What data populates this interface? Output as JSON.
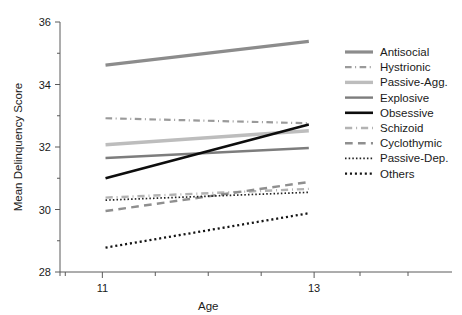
{
  "chart_data": {
    "type": "line",
    "title": "",
    "xlabel": "Age",
    "ylabel": "Mean Delinquency Score",
    "xlim": [
      10.6,
      13.15
    ],
    "ylim": [
      28,
      36
    ],
    "x": [
      11.03,
      12.95
    ],
    "xticks": [
      11,
      13
    ],
    "xtick_labels": [
      "11",
      "13"
    ],
    "xminor_ticks": [
      10.6,
      10.65,
      11.5,
      12.0,
      12.5
    ],
    "yticks": [
      28,
      30,
      32,
      34,
      36
    ],
    "ytick_labels": [
      "28",
      "30",
      "32",
      "34",
      "36"
    ],
    "yminor_ticks": [
      29,
      31,
      33,
      35
    ],
    "grid": false,
    "legend_position": "right",
    "series": [
      {
        "name": "Antisocial",
        "values": [
          34.62,
          35.38
        ],
        "color": "#8c8c8c",
        "dash": "none",
        "width": 3.2
      },
      {
        "name": "Hystrionic",
        "values": [
          32.92,
          32.76
        ],
        "color": "#9a9a9a",
        "dash": "dashdot",
        "width": 2.2
      },
      {
        "name": "Passive-Agg.",
        "values": [
          32.07,
          32.52
        ],
        "color": "#bdbdbd",
        "dash": "none",
        "width": 3.4
      },
      {
        "name": "Explosive",
        "values": [
          31.65,
          31.97
        ],
        "color": "#7d7d7d",
        "dash": "none",
        "width": 2.4
      },
      {
        "name": "Obsessive",
        "values": [
          31.0,
          32.72
        ],
        "color": "#0d0d0d",
        "dash": "none",
        "width": 2.6
      },
      {
        "name": "Schizoid",
        "values": [
          30.38,
          30.66
        ],
        "color": "#b3b3b3",
        "dash": "dashdot",
        "width": 2.4
      },
      {
        "name": "Cyclothymic",
        "values": [
          29.95,
          30.88
        ],
        "color": "#8f8f8f",
        "dash": "dashed",
        "width": 2.4
      },
      {
        "name": "Passive-Dep.",
        "values": [
          30.3,
          30.55
        ],
        "color": "#222222",
        "dash": "dotted",
        "width": 1.7
      },
      {
        "name": "Others",
        "values": [
          28.78,
          29.88
        ],
        "color": "#141414",
        "dash": "dotted",
        "width": 2.3
      }
    ]
  },
  "axes": {
    "x_title": "Age",
    "y_title": "Mean Delinquency Score"
  },
  "legend": {
    "items": [
      {
        "label": "Antisocial"
      },
      {
        "label": "Hystrionic"
      },
      {
        "label": "Passive-Agg."
      },
      {
        "label": "Explosive"
      },
      {
        "label": "Obsessive"
      },
      {
        "label": "Schizoid"
      },
      {
        "label": "Cyclothymic"
      },
      {
        "label": "Passive-Dep."
      },
      {
        "label": "Others"
      }
    ]
  }
}
